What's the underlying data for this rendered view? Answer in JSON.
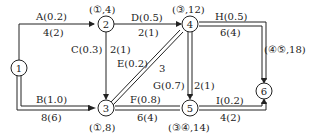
{
  "nodes": [
    {
      "id": "1",
      "label": "1"
    },
    {
      "id": "2",
      "label": "2",
      "annotation": "(①,4)"
    },
    {
      "id": "3",
      "label": "3",
      "annotation": "(①,8)"
    },
    {
      "id": "4",
      "label": "4",
      "annotation": "(③,12)"
    },
    {
      "id": "5",
      "label": "5",
      "annotation": "(③④,14)"
    },
    {
      "id": "6",
      "label": "6",
      "annotation": "(④⑤,18)"
    }
  ],
  "edges": [
    {
      "from": "1",
      "to": "2",
      "name": "A(0.2)",
      "value": "4(2)",
      "critical": false
    },
    {
      "from": "1",
      "to": "3",
      "name": "B(1.0)",
      "value": "8(6)",
      "critical": true
    },
    {
      "from": "2",
      "to": "3",
      "name": "C(0.3)",
      "value": "2(1)",
      "critical": false
    },
    {
      "from": "2",
      "to": "4",
      "name": "D(0.5)",
      "value": "2(1)",
      "critical": false
    },
    {
      "from": "3",
      "to": "4",
      "name": "E(0.2)",
      "value": "3",
      "critical": true
    },
    {
      "from": "3",
      "to": "5",
      "name": "F(0.8)",
      "value": "6(4)",
      "critical": true
    },
    {
      "from": "4",
      "to": "5",
      "name": "G(0.7)",
      "value": "2(1)",
      "critical": true
    },
    {
      "from": "4",
      "to": "6",
      "name": "H(0.5)",
      "value": "6(4)",
      "critical": true
    },
    {
      "from": "5",
      "to": "6",
      "name": "I(0.2)",
      "value": "4(2)",
      "critical": true
    }
  ]
}
